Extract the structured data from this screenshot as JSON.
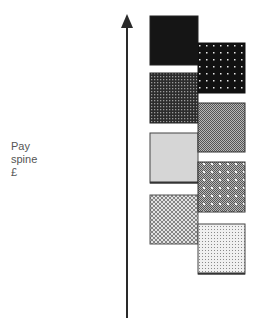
{
  "axis": {
    "label_lines": [
      "Pay",
      "spine",
      "£"
    ],
    "direction": "up",
    "color": "#2a2a2a"
  },
  "boxes": [
    {
      "id": 1,
      "column": "left",
      "pattern": "solid-black",
      "x": 150,
      "y": 16,
      "w": 48,
      "h": 49
    },
    {
      "id": 2,
      "column": "right",
      "pattern": "black-white-dots",
      "x": 198,
      "y": 43,
      "w": 47,
      "h": 50
    },
    {
      "id": 3,
      "column": "left",
      "pattern": "dark-grid",
      "x": 150,
      "y": 73,
      "w": 48,
      "h": 50
    },
    {
      "id": 4,
      "column": "right",
      "pattern": "mid-gray-checker",
      "x": 198,
      "y": 103,
      "w": 47,
      "h": 49
    },
    {
      "id": 5,
      "column": "left",
      "pattern": "light-gray-solid",
      "x": 150,
      "y": 133,
      "w": 48,
      "h": 50
    },
    {
      "id": 6,
      "column": "right",
      "pattern": "gray-checker-dots",
      "x": 198,
      "y": 162,
      "w": 47,
      "h": 50
    },
    {
      "id": 7,
      "column": "left",
      "pattern": "light-diamond-lattice",
      "x": 150,
      "y": 195,
      "w": 48,
      "h": 49
    },
    {
      "id": 8,
      "column": "right",
      "pattern": "very-light-fine-dots",
      "x": 198,
      "y": 224,
      "w": 47,
      "h": 50
    }
  ]
}
